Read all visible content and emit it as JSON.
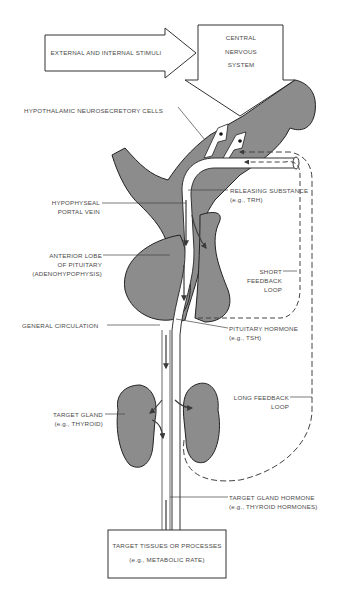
{
  "figure": {
    "type": "endocrine feedback diagram",
    "colors": {
      "tissue": "#8c8c8c",
      "outline": "#2a2a2a",
      "text": "#4a4a4a",
      "background": "#ffffff"
    }
  },
  "nodes": {
    "stimuli": "EXTERNAL AND INTERNAL STIMULI",
    "cns_line1": "CENTRAL",
    "cns_line2": "NERVOUS",
    "cns_line3": "SYSTEM",
    "target_box_line1": "TARGET TISSUES OR PROCESSES",
    "target_box_line2": "(e.g., METABOLIC RATE)"
  },
  "labels": {
    "hypothalamic": "HYPOTHALAMIC NEUROSECRETORY CELLS",
    "portal_line1": "HYPOPHYSEAL",
    "portal_line2": "PORTAL VEIN",
    "releasing_line1": "RELEASING SUBSTANCE",
    "releasing_line2": "(e.g., TRH)",
    "anterior_line1": "ANTERIOR LOBE",
    "anterior_line2": "OF PITUITARY",
    "anterior_line3": "(ADENOHYPOPHYSIS)",
    "short_line1": "SHORT",
    "short_line2": "FEEDBACK",
    "short_line3": "LOOP",
    "general": "GENERAL CIRCULATION",
    "pituitary_line1": "PITUITARY HORMONE",
    "pituitary_line2": "(e.g., TSH)",
    "long_line1": "LONG FEEDBACK",
    "long_line2": "LOOP",
    "gland_line1": "TARGET GLAND",
    "gland_line2": "(e.g., THYROID)",
    "glandhormone_line1": "TARGET GLAND HORMONE",
    "glandhormone_line2": "(e.g., THYROID HORMONES)"
  }
}
